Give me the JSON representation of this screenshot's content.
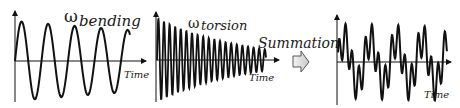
{
  "panels": {
    "bending": {
      "symbol": "ω",
      "subscript": "bending",
      "axis_label": "Time"
    },
    "torsion": {
      "symbol": "ω",
      "subscript": "torsion",
      "axis_label": "Time"
    },
    "summation": {
      "label": "Summation",
      "axis_label": "Time"
    }
  },
  "colors": {
    "line": "#111111",
    "arrow_fill": "#dddddd",
    "arrow_stroke": "#555555"
  }
}
